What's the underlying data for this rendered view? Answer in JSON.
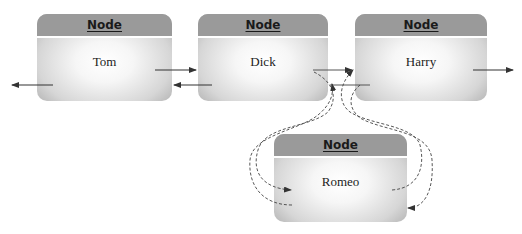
{
  "diagram": {
    "type": "doubly-linked-list-insertion",
    "nodes": [
      {
        "id": "tom",
        "title": "Node",
        "value": "Tom"
      },
      {
        "id": "dick",
        "title": "Node",
        "value": "Dick"
      },
      {
        "id": "harry",
        "title": "Node",
        "value": "Harry"
      },
      {
        "id": "romeo",
        "title": "Node",
        "value": "Romeo"
      }
    ],
    "edges": [
      {
        "from": "tom",
        "to": "dick",
        "style": "solid",
        "kind": "next"
      },
      {
        "from": "dick",
        "to": "tom",
        "style": "solid",
        "kind": "prev"
      },
      {
        "from": "tom",
        "to": "left",
        "style": "solid",
        "kind": "prev"
      },
      {
        "from": "dick",
        "to": "harry",
        "style": "solid",
        "kind": "next"
      },
      {
        "from": "harry",
        "to": "dick",
        "style": "solid",
        "kind": "prev"
      },
      {
        "from": "harry",
        "to": "right",
        "style": "solid",
        "kind": "next"
      },
      {
        "from": "dick",
        "to": "romeo",
        "style": "dashed",
        "kind": "next"
      },
      {
        "from": "romeo",
        "to": "dick",
        "style": "dashed",
        "kind": "prev"
      },
      {
        "from": "romeo",
        "to": "harry",
        "style": "dashed",
        "kind": "next"
      },
      {
        "from": "harry",
        "to": "romeo",
        "style": "dashed",
        "kind": "prev"
      }
    ],
    "colors": {
      "header": "#9a9a9a",
      "body_center": "#ffffff",
      "body_edge": "#a9a9a9",
      "arrow": "#333333"
    }
  }
}
